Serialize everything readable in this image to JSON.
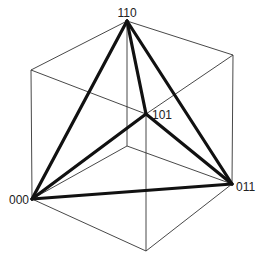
{
  "diagram": {
    "title": "",
    "colors": {
      "background": "#ffffff",
      "cube_edge": "#333333",
      "tetra_edge": "#111111",
      "label": "#222222"
    },
    "vertices": {
      "v110": {
        "x": 127,
        "y": 21,
        "label": "110"
      },
      "vTL": {
        "x": 31,
        "y": 70
      },
      "vTR": {
        "x": 233,
        "y": 55
      },
      "v000": {
        "x": 32,
        "y": 199,
        "label": "000"
      },
      "v011": {
        "x": 232,
        "y": 184,
        "label": "011"
      },
      "vBot": {
        "x": 146,
        "y": 251
      },
      "v101": {
        "x": 146,
        "y": 114,
        "label": "101"
      },
      "vBack": {
        "x": 127,
        "y": 146
      }
    },
    "labels": {
      "l110": "110",
      "l101": "101",
      "l000": "000",
      "l011": "011"
    },
    "cube_edges": [
      [
        "v110",
        "vTL"
      ],
      [
        "v110",
        "vTR"
      ],
      [
        "vTL",
        "v000"
      ],
      [
        "vTR",
        "v011"
      ],
      [
        "v000",
        "vBot"
      ],
      [
        "v011",
        "vBot"
      ],
      [
        "v101",
        "vTL"
      ],
      [
        "v101",
        "vTR"
      ],
      [
        "v101",
        "vBot"
      ],
      [
        "vBack",
        "v110"
      ],
      [
        "vBack",
        "v000"
      ],
      [
        "vBack",
        "v011"
      ]
    ],
    "tetrahedron_edges": [
      [
        "v110",
        "v000"
      ],
      [
        "v110",
        "v101"
      ],
      [
        "v110",
        "v011"
      ],
      [
        "v000",
        "v101"
      ],
      [
        "v101",
        "v011"
      ],
      [
        "v000",
        "v011"
      ]
    ]
  }
}
